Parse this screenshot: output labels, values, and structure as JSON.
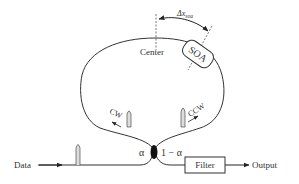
{
  "diagram": {
    "type": "nonlinear optical loop mirror with SOA",
    "labels": {
      "center": "Center",
      "soa": "SOA",
      "delta_x_main": "Δx",
      "delta_x_sub": "soa",
      "cw": "CW",
      "ccw": "CCW",
      "alpha": "α",
      "one_minus_alpha": "1 − α",
      "data": "Data",
      "filter": "Filter",
      "output": "Output"
    },
    "colors": {
      "stroke": "#333333",
      "background": "#ffffff",
      "pulse_fill": "#dddddd"
    }
  }
}
